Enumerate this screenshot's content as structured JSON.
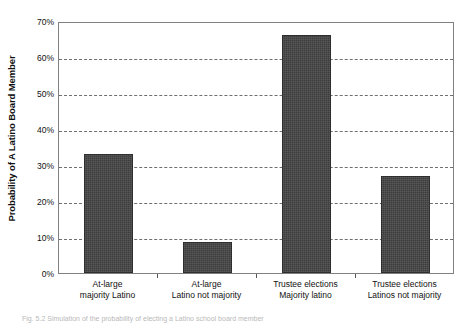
{
  "chart_data": {
    "type": "bar",
    "title": "",
    "xlabel": "",
    "ylabel": "Probability of A Latino Board Member",
    "ylim": [
      0,
      70
    ],
    "grid": true,
    "legend": false,
    "categories": [
      "At-large majority Latino",
      "At-large Latino not majority",
      "Trustee elections Majority latino",
      "Trustee elections Latinos not majority"
    ],
    "category_lines": [
      {
        "line1": "At-large",
        "line2": "majority Latino"
      },
      {
        "line1": "At-large",
        "line2": "Latino not majority"
      },
      {
        "line1": "Trustee elections",
        "line2": "Majority latino"
      },
      {
        "line1": "Trustee elections",
        "line2": "Latinos not majority"
      }
    ],
    "values": [
      33,
      8.5,
      66,
      27
    ],
    "value_labels": [
      "33%",
      "8.5%",
      "66%",
      "27%"
    ],
    "ytick_labels": [
      "0%",
      "10%",
      "20%",
      "30%",
      "40%",
      "50%",
      "60%",
      "70%"
    ],
    "ytick_values": [
      0,
      10,
      20,
      30,
      40,
      50,
      60,
      70
    ],
    "bar_color": "#444444",
    "bar_edge_color": "#2e2e2e",
    "grid_color": "#6f6f6f",
    "axis_color": "#808080"
  },
  "caption": {
    "text": "Fig. 5.2  Simulation of the probability of electing a Latino school board member"
  }
}
